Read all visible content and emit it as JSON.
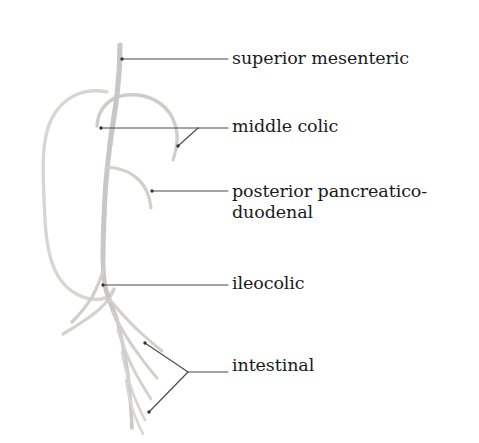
{
  "figure": {
    "background_color": "#ffffff",
    "vessel_color": "#c9c7c4",
    "vessel_color_light": "#d9d7d4",
    "leader_color": "#4a4a4a",
    "text_color": "#1a1a1a"
  },
  "labels": {
    "superior_mesenteric": "superior mesenteric",
    "middle_colic": "middle colic",
    "posterior_pancreaticoduodenal_line1": "posterior pancreatico-",
    "posterior_pancreaticoduodenal_line2": "duodenal",
    "ileocolic": "ileocolic",
    "intestinal": "intestinal"
  },
  "annotations": [
    {
      "name": "superior-mesenteric",
      "text": "superior mesenteric",
      "leader_type": "single",
      "target": [
        122,
        59
      ],
      "label_anchor": [
        228,
        59
      ]
    },
    {
      "name": "middle-colic",
      "text": "middle colic",
      "leader_type": "forked",
      "targets": [
        [
          101,
          128
        ],
        [
          178,
          146
        ]
      ],
      "fork_vertex": [
        198,
        128
      ],
      "label_anchor": [
        228,
        128
      ]
    },
    {
      "name": "posterior-pancreaticoduodenal",
      "text": "posterior pancreatico- duodenal",
      "leader_type": "single",
      "target": [
        152,
        191
      ],
      "label_anchor": [
        228,
        191
      ]
    },
    {
      "name": "ileocolic",
      "text": "ileocolic",
      "leader_type": "single",
      "target": [
        103,
        285
      ],
      "label_anchor": [
        228,
        285
      ]
    },
    {
      "name": "intestinal",
      "text": "intestinal",
      "leader_type": "forked",
      "targets": [
        [
          145,
          343
        ],
        [
          149,
          412
        ]
      ],
      "fork_vertex": [
        188,
        372
      ],
      "label_anchor": [
        228,
        372
      ]
    }
  ],
  "vessels": [
    {
      "name": "superior-mesenteric-trunk",
      "description": "main vertical trunk descending from top"
    },
    {
      "name": "middle-colic-arch",
      "description": "arch curving right and down from trunk"
    },
    {
      "name": "colon-loop",
      "description": "large oval colon outline on left"
    },
    {
      "name": "posterior-pancreaticoduodenal-branch",
      "description": "short branch curving right then down"
    },
    {
      "name": "ileocolic-branch",
      "description": "branch curving left and down toward cecum"
    },
    {
      "name": "intestinal-branches",
      "description": "fan of jejunal and ileal branches to lower right"
    }
  ]
}
